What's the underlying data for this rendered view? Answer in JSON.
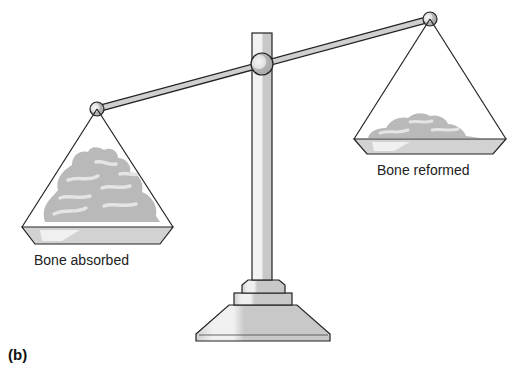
{
  "figure": {
    "panel_label": "(b)",
    "left_pan_label": "Bone absorbed",
    "right_pan_label": "Bone reformed",
    "colors": {
      "outline": "#222222",
      "metal_fill": "#cfcfcf",
      "metal_highlight": "#efefef",
      "bone_fill": "#b9b9b9",
      "bone_highlight": "#e2e2e2"
    }
  }
}
